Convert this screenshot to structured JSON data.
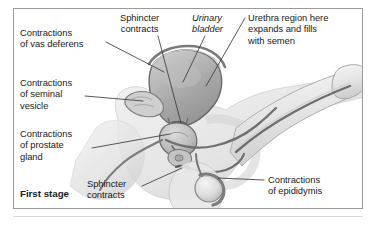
{
  "figure": {
    "caption": "First stage",
    "frame_color": "#9a9a9a",
    "background": "#ffffff",
    "ink_color": "#1a1a1a",
    "leader_color": "#3a3a3a"
  },
  "labels": [
    {
      "id": "vas-deferens",
      "lines": [
        "Contractions",
        "of vas deferens"
      ],
      "style": "plain",
      "x": 20,
      "y": 27
    },
    {
      "id": "seminal-vesicle",
      "lines": [
        "Contractions",
        "of seminal",
        "vesicle"
      ],
      "style": "plain",
      "x": 20,
      "y": 77
    },
    {
      "id": "prostate-gland",
      "lines": [
        "Contractions",
        "of prostate",
        "gland"
      ],
      "style": "plain",
      "x": 20,
      "y": 128
    },
    {
      "id": "sphincter-top",
      "lines": [
        "Sphincter",
        "contracts"
      ],
      "style": "plain",
      "x": 123,
      "y": 12
    },
    {
      "id": "urinary-bladder",
      "lines": [
        "Urinary",
        "bladder"
      ],
      "style": "italic",
      "x": 192,
      "y": 12
    },
    {
      "id": "urethra-region",
      "lines": [
        "Urethra region here",
        "expands and fills",
        "with semen"
      ],
      "style": "plain",
      "x": 248,
      "y": 12
    },
    {
      "id": "sphincter-bottom",
      "lines": [
        "Sphincter",
        "contracts"
      ],
      "style": "plain",
      "x": 87,
      "y": 178
    },
    {
      "id": "epididymis",
      "lines": [
        "Contractions",
        "of epididymis"
      ],
      "style": "plain",
      "x": 268,
      "y": 174
    }
  ],
  "anatomy_parts": [
    "urinary-bladder",
    "prostate-gland",
    "seminal-vesicle",
    "vas-deferens",
    "urethra",
    "penis-shaft",
    "glans",
    "testis",
    "epididymis",
    "pelvic-outline",
    "internal-sphincter",
    "external-sphincter"
  ]
}
